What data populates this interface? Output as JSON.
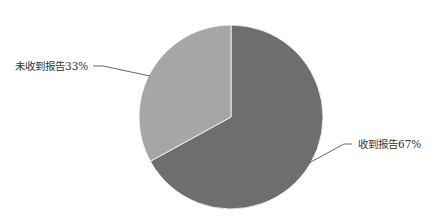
{
  "chart_data": {
    "type": "pie",
    "title": "",
    "categories": [
      "收到报告",
      "未收到报告"
    ],
    "values": [
      67,
      33
    ],
    "unit": "%",
    "labels": [
      "收到报告67%",
      "未收到报告33%"
    ],
    "colors": [
      "#6e6e6e",
      "#a6a6a6"
    ],
    "start_angle": "12 o'clock",
    "direction": "clockwise",
    "legend": "none (leader-line labels)"
  },
  "labels": {
    "received": "收到报告67%",
    "not_received": "未收到报告33%"
  }
}
